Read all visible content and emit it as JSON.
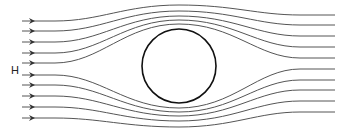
{
  "diagram": {
    "label": "H",
    "label_pos": {
      "x": 11,
      "y": 74
    },
    "stroke_color": "#555555",
    "obstacle_color": "#111111",
    "obstacle": {
      "shape": "circle",
      "cx": 179,
      "cy": 66,
      "r": 37
    },
    "streamlines": [
      {
        "y_in": 21,
        "y_mid": 5,
        "y_out": 15
      },
      {
        "y_in": 31,
        "y_mid": 11,
        "y_out": 25
      },
      {
        "y_in": 42,
        "y_mid": 16,
        "y_out": 36
      },
      {
        "y_in": 53,
        "y_mid": 20,
        "y_out": 47
      },
      {
        "y_in": 63,
        "y_mid": 24,
        "y_out": 58
      },
      {
        "y_in": 75,
        "y_mid": 108,
        "y_out": 69
      },
      {
        "y_in": 85,
        "y_mid": 112,
        "y_out": 80
      },
      {
        "y_in": 96,
        "y_mid": 116,
        "y_out": 90
      },
      {
        "y_in": 107,
        "y_mid": 121,
        "y_out": 101
      },
      {
        "y_in": 118,
        "y_mid": 127,
        "y_out": 112
      }
    ],
    "x_start": 22,
    "x_arrow": 35,
    "x_mid": 179,
    "x_end": 335,
    "arrow_icon": "arrowhead-right"
  }
}
